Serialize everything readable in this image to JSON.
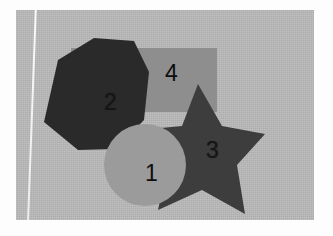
{
  "image": {
    "kind": "scanned-photograph",
    "description": "Overlapping geometric shapes labelled with numbers",
    "paper_color": "#fdfdfd",
    "backdrop_color": "#b9b9b9"
  },
  "canvas": {
    "width": 298,
    "height": 210,
    "offset_x": 16,
    "offset_y": 10
  },
  "shapes": [
    {
      "id": "rectangle",
      "name": "rectangle",
      "label": "4",
      "color": "#8e8e8e",
      "label_x": 149,
      "label_y": 52,
      "geometry": {
        "x": 55,
        "y": 38,
        "width": 146,
        "height": 64
      },
      "z": 1
    },
    {
      "id": "octagon",
      "name": "octagon",
      "label": "2",
      "color": "#2a2a2a",
      "label_x": 88,
      "label_y": 81,
      "geometry": {
        "points": "42,50 78,28 118,31 133,62 128,110 100,139 62,140 28,112"
      },
      "z": 3
    },
    {
      "id": "star",
      "name": "five-pointed-star",
      "label": "3",
      "color": "#3d3d3d",
      "label_x": 190,
      "label_y": 129,
      "geometry": {
        "points": "182,74 206,116 249,124 221,155 229,204 186,180 142,200 152,152 123,120 166,116"
      },
      "z": 2
    },
    {
      "id": "circle",
      "name": "circle",
      "label": "1",
      "color": "#9b9b9b",
      "label_x": 129,
      "label_y": 152,
      "geometry": {
        "cx": 129,
        "cy": 155,
        "r": 41
      },
      "z": 4
    }
  ],
  "labels": {
    "one": "1",
    "two": "2",
    "three": "3",
    "four": "4"
  }
}
